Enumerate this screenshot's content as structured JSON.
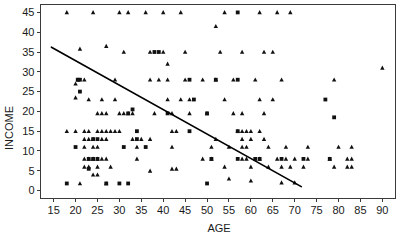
{
  "chart_data": {
    "type": "scatter",
    "title": "",
    "xlabel": "AGE",
    "ylabel": "INCOME",
    "xlim": [
      12,
      93
    ],
    "ylim": [
      -2,
      47
    ],
    "xticks": [
      15,
      20,
      25,
      30,
      35,
      40,
      45,
      50,
      55,
      60,
      65,
      70,
      75,
      80,
      85,
      90
    ],
    "yticks": [
      0,
      5,
      10,
      15,
      20,
      25,
      30,
      35,
      40,
      45
    ],
    "grid": false,
    "legend": "none",
    "marker_types": [
      "triangle",
      "square"
    ],
    "trendline": {
      "label": "regression line",
      "x0": 14.5,
      "y0": 36.2,
      "x1": 71.5,
      "y1": 1.0
    },
    "series": [
      {
        "name": "triangle",
        "marker": "triangle",
        "points": [
          [
            18,
            45
          ],
          [
            24,
            45
          ],
          [
            30,
            45
          ],
          [
            32,
            45
          ],
          [
            36,
            45
          ],
          [
            40,
            45
          ],
          [
            44,
            45
          ],
          [
            54,
            45
          ],
          [
            62,
            45
          ],
          [
            66,
            45
          ],
          [
            69,
            45
          ],
          [
            52,
            41.5
          ],
          [
            21,
            35.8
          ],
          [
            27,
            36.5
          ],
          [
            31,
            35
          ],
          [
            37,
            35
          ],
          [
            40,
            35
          ],
          [
            45,
            35
          ],
          [
            53,
            35
          ],
          [
            58,
            35
          ],
          [
            63,
            35
          ],
          [
            65,
            35
          ],
          [
            41,
            32
          ],
          [
            20,
            27
          ],
          [
            20.5,
            28
          ],
          [
            22,
            28
          ],
          [
            29,
            28
          ],
          [
            37,
            28
          ],
          [
            39,
            28
          ],
          [
            41,
            28
          ],
          [
            45,
            28
          ],
          [
            49,
            28
          ],
          [
            52,
            28
          ],
          [
            56,
            28
          ],
          [
            61,
            28
          ],
          [
            67,
            28
          ],
          [
            79,
            28
          ],
          [
            20,
            23.5
          ],
          [
            23,
            23
          ],
          [
            26,
            23
          ],
          [
            29,
            23
          ],
          [
            41,
            23
          ],
          [
            44,
            23
          ],
          [
            46,
            23
          ],
          [
            54,
            23
          ],
          [
            62,
            23
          ],
          [
            65,
            23
          ],
          [
            25,
            19.5
          ],
          [
            26,
            19.5
          ],
          [
            27,
            19.5
          ],
          [
            30,
            19.5
          ],
          [
            31,
            19.5
          ],
          [
            32,
            19.5
          ],
          [
            33,
            19.5
          ],
          [
            38,
            19.5
          ],
          [
            42,
            19.5
          ],
          [
            46,
            19.5
          ],
          [
            50,
            19.5
          ],
          [
            56,
            19.5
          ],
          [
            58,
            19.5
          ],
          [
            63,
            19.5
          ],
          [
            18,
            15
          ],
          [
            20,
            15
          ],
          [
            22,
            15
          ],
          [
            23,
            15
          ],
          [
            25,
            15
          ],
          [
            26,
            15
          ],
          [
            27,
            15
          ],
          [
            28,
            15
          ],
          [
            29,
            15
          ],
          [
            30,
            15
          ],
          [
            42,
            15
          ],
          [
            43,
            15
          ],
          [
            57,
            15
          ],
          [
            58,
            15
          ],
          [
            59,
            15
          ],
          [
            60,
            15
          ],
          [
            62,
            15
          ],
          [
            22,
            13
          ],
          [
            23,
            13
          ],
          [
            24,
            13
          ],
          [
            26,
            13
          ],
          [
            27,
            13
          ],
          [
            33,
            13
          ],
          [
            35,
            13
          ],
          [
            37,
            13
          ],
          [
            52,
            13
          ],
          [
            58,
            13
          ],
          [
            60,
            13
          ],
          [
            63,
            13
          ],
          [
            22,
            11
          ],
          [
            24,
            11
          ],
          [
            25,
            11
          ],
          [
            34,
            11
          ],
          [
            42,
            11
          ],
          [
            51,
            11
          ],
          [
            55,
            11
          ],
          [
            58,
            11
          ],
          [
            59,
            11
          ],
          [
            64,
            11
          ],
          [
            68,
            11
          ],
          [
            73,
            11
          ],
          [
            80,
            11
          ],
          [
            83,
            11
          ],
          [
            22,
            8
          ],
          [
            23,
            8
          ],
          [
            24,
            8
          ],
          [
            25,
            8
          ],
          [
            26,
            8
          ],
          [
            27,
            8
          ],
          [
            34,
            8
          ],
          [
            49,
            8
          ],
          [
            51,
            8
          ],
          [
            58,
            8
          ],
          [
            59,
            8
          ],
          [
            62,
            8
          ],
          [
            66,
            8
          ],
          [
            68,
            8
          ],
          [
            70,
            8
          ],
          [
            73,
            8
          ],
          [
            78,
            8
          ],
          [
            82,
            8
          ],
          [
            83,
            8
          ],
          [
            22,
            6
          ],
          [
            23,
            6
          ],
          [
            25,
            6
          ],
          [
            28,
            6
          ],
          [
            37,
            5
          ],
          [
            42,
            5.5
          ],
          [
            43,
            5.5
          ],
          [
            54,
            6
          ],
          [
            60,
            6
          ],
          [
            64,
            6
          ],
          [
            67,
            6
          ],
          [
            69,
            6
          ],
          [
            72,
            6
          ],
          [
            79,
            6
          ],
          [
            82,
            6
          ],
          [
            83,
            6
          ],
          [
            24,
            4
          ],
          [
            25,
            4
          ],
          [
            55,
            3
          ],
          [
            60,
            2.5
          ],
          [
            67,
            2
          ],
          [
            70,
            2
          ],
          [
            21,
            1.8
          ],
          [
            27,
            1.8
          ],
          [
            90,
            31
          ]
        ]
      },
      {
        "name": "square",
        "marker": "square",
        "points": [
          [
            57,
            45
          ],
          [
            38,
            35
          ],
          [
            39,
            35
          ],
          [
            20.5,
            28
          ],
          [
            21,
            28
          ],
          [
            46,
            28
          ],
          [
            52,
            28
          ],
          [
            57,
            28
          ],
          [
            21,
            25
          ],
          [
            47,
            23
          ],
          [
            77,
            23
          ],
          [
            32,
            19.5
          ],
          [
            33,
            20.5
          ],
          [
            41,
            19.5
          ],
          [
            50,
            19.5
          ],
          [
            34,
            15
          ],
          [
            46,
            15
          ],
          [
            57,
            15
          ],
          [
            24,
            13
          ],
          [
            25,
            13
          ],
          [
            34,
            13
          ],
          [
            20,
            11
          ],
          [
            31,
            11
          ],
          [
            36,
            11
          ],
          [
            23,
            8
          ],
          [
            24,
            8
          ],
          [
            25,
            8
          ],
          [
            51,
            8
          ],
          [
            57,
            8
          ],
          [
            61,
            8
          ],
          [
            62,
            8
          ],
          [
            67,
            8
          ],
          [
            72,
            8
          ],
          [
            78,
            8
          ],
          [
            23,
            5.5
          ],
          [
            79,
            18.5
          ],
          [
            18,
            1.8
          ],
          [
            27,
            1.8
          ],
          [
            30,
            1.8
          ],
          [
            32,
            1.8
          ],
          [
            50,
            1.8
          ]
        ]
      }
    ]
  },
  "axis": {
    "x_title": "AGE",
    "y_title": "INCOME"
  }
}
